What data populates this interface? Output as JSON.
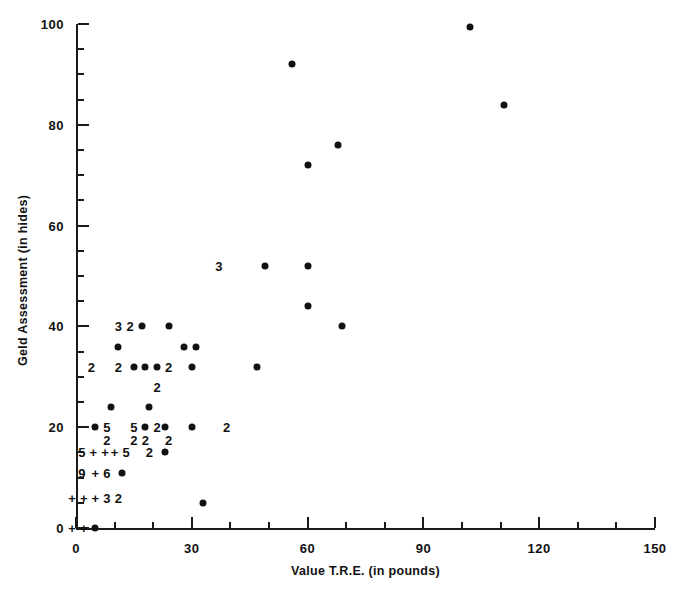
{
  "chart_data": {
    "type": "scatter",
    "title": "",
    "xlabel": "Value T.R.E. (in pounds)",
    "ylabel": "Geld Assessment (in hides)",
    "xlim": [
      0,
      150
    ],
    "ylim": [
      0,
      100
    ],
    "grid": false,
    "legend": null,
    "x_major_ticks": [
      0,
      30,
      60,
      90,
      120,
      150
    ],
    "x_major_tick_labels": [
      "0",
      "30",
      "60",
      "90",
      "120",
      "150"
    ],
    "x_minor_tick_interval": 10,
    "y_major_ticks": [
      0,
      20,
      40,
      60,
      80,
      100
    ],
    "y_major_tick_labels": [
      "0",
      "20",
      "40",
      "60",
      "80",
      "100"
    ],
    "y_minor_tick_interval": 5,
    "marker": "filled-circle",
    "marker_color": "#111111",
    "overplot_note": "Digits and '+' glyphs mark coincident observations; a digit is the count of points at that location, '+' marks a dense overlap position.",
    "points": [
      {
        "x": 5,
        "y": 20,
        "marker": "dot"
      },
      {
        "x": 8,
        "y": 20,
        "marker": "5"
      },
      {
        "x": 15,
        "y": 20,
        "marker": "5"
      },
      {
        "x": 18,
        "y": 20,
        "marker": "dot"
      },
      {
        "x": 21,
        "y": 20,
        "marker": "2"
      },
      {
        "x": 23,
        "y": 20,
        "marker": "dot"
      },
      {
        "x": 30,
        "y": 20,
        "marker": "dot"
      },
      {
        "x": 39,
        "y": 20,
        "marker": "2"
      },
      {
        "x": 8,
        "y": 17.5,
        "marker": "2"
      },
      {
        "x": 15,
        "y": 17.5,
        "marker": "2"
      },
      {
        "x": 18,
        "y": 17.5,
        "marker": "2"
      },
      {
        "x": 24,
        "y": 17.5,
        "marker": "2"
      },
      {
        "x": 1.5,
        "y": 15,
        "marker": "5"
      },
      {
        "x": 4.5,
        "y": 15,
        "marker": "+"
      },
      {
        "x": 7.5,
        "y": 15,
        "marker": "+"
      },
      {
        "x": 10,
        "y": 15,
        "marker": "+"
      },
      {
        "x": 13,
        "y": 15,
        "marker": "5"
      },
      {
        "x": 19,
        "y": 15,
        "marker": "2"
      },
      {
        "x": 23,
        "y": 15,
        "marker": "dot"
      },
      {
        "x": 1.5,
        "y": 11,
        "marker": "9"
      },
      {
        "x": 5,
        "y": 11,
        "marker": "+"
      },
      {
        "x": 8,
        "y": 11,
        "marker": "6"
      },
      {
        "x": 12,
        "y": 11,
        "marker": "dot"
      },
      {
        "x": -1,
        "y": 6,
        "marker": "+"
      },
      {
        "x": 2,
        "y": 6,
        "marker": "+"
      },
      {
        "x": 5,
        "y": 6,
        "marker": "+"
      },
      {
        "x": 8,
        "y": 6,
        "marker": "3"
      },
      {
        "x": 11,
        "y": 6,
        "marker": "2"
      },
      {
        "x": 33,
        "y": 5,
        "marker": "dot"
      },
      {
        "x": -1,
        "y": 0,
        "marker": "+"
      },
      {
        "x": 2,
        "y": 0,
        "marker": "+"
      },
      {
        "x": 5,
        "y": 0,
        "marker": "dot"
      },
      {
        "x": 9,
        "y": 24,
        "marker": "dot"
      },
      {
        "x": 19,
        "y": 24,
        "marker": "dot"
      },
      {
        "x": 4,
        "y": 32,
        "marker": "2"
      },
      {
        "x": 11,
        "y": 32,
        "marker": "2"
      },
      {
        "x": 15,
        "y": 32,
        "marker": "dot"
      },
      {
        "x": 18,
        "y": 32,
        "marker": "dot"
      },
      {
        "x": 21,
        "y": 32,
        "marker": "dot"
      },
      {
        "x": 24,
        "y": 32,
        "marker": "2"
      },
      {
        "x": 30,
        "y": 32,
        "marker": "dot"
      },
      {
        "x": 47,
        "y": 32,
        "marker": "dot"
      },
      {
        "x": 21,
        "y": 28,
        "marker": "2"
      },
      {
        "x": 11,
        "y": 36,
        "marker": "dot"
      },
      {
        "x": 28,
        "y": 36,
        "marker": "dot"
      },
      {
        "x": 31,
        "y": 36,
        "marker": "dot"
      },
      {
        "x": 11,
        "y": 40,
        "marker": "3"
      },
      {
        "x": 14,
        "y": 40,
        "marker": "2"
      },
      {
        "x": 17,
        "y": 40,
        "marker": "dot"
      },
      {
        "x": 24,
        "y": 40,
        "marker": "dot"
      },
      {
        "x": 69,
        "y": 40,
        "marker": "dot"
      },
      {
        "x": 60,
        "y": 44,
        "marker": "dot"
      },
      {
        "x": 37,
        "y": 52,
        "marker": "3"
      },
      {
        "x": 49,
        "y": 52,
        "marker": "dot"
      },
      {
        "x": 60,
        "y": 52,
        "marker": "dot"
      },
      {
        "x": 60,
        "y": 72,
        "marker": "dot"
      },
      {
        "x": 68,
        "y": 76,
        "marker": "dot"
      },
      {
        "x": 56,
        "y": 92,
        "marker": "dot"
      },
      {
        "x": 102,
        "y": 99.5,
        "marker": "dot"
      },
      {
        "x": 111,
        "y": 84,
        "marker": "dot"
      }
    ]
  }
}
